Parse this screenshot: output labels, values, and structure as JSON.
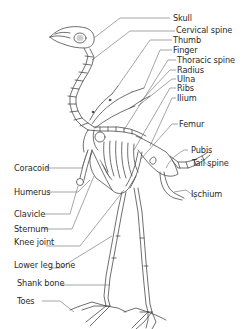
{
  "diagram": {
    "colors": {
      "line": "#4a4a4a",
      "leader": "#6a6a6a",
      "text": "#2a2a2a",
      "background": "#ffffff"
    },
    "labels_right": [
      {
        "id": "skull",
        "text": "Skull"
      },
      {
        "id": "cervical-spine",
        "text": "Cervical spine"
      },
      {
        "id": "thumb",
        "text": "Thumb"
      },
      {
        "id": "finger",
        "text": "Finger"
      },
      {
        "id": "thoracic-spine",
        "text": "Thoracic spine"
      },
      {
        "id": "radius",
        "text": "Radius"
      },
      {
        "id": "ulna",
        "text": "Ulna"
      },
      {
        "id": "ribs",
        "text": "Ribs"
      },
      {
        "id": "ilium",
        "text": "Ilium"
      },
      {
        "id": "femur",
        "text": "Femur"
      },
      {
        "id": "pubis",
        "text": "Pubis"
      },
      {
        "id": "tail-spine",
        "text": "Tail spine"
      },
      {
        "id": "ischium",
        "text": "Ischium"
      }
    ],
    "labels_left": [
      {
        "id": "coracoid",
        "text": "Coracoid"
      },
      {
        "id": "humerus",
        "text": "Humerus"
      },
      {
        "id": "clavicle",
        "text": "Clavicle"
      },
      {
        "id": "sternum",
        "text": "Sternum"
      },
      {
        "id": "knee-joint",
        "text": "Knee joint"
      },
      {
        "id": "lower-leg-bone",
        "text": "Lower leg bone"
      },
      {
        "id": "shank-bone",
        "text": "Shank bone"
      },
      {
        "id": "toes",
        "text": "Toes"
      }
    ]
  }
}
